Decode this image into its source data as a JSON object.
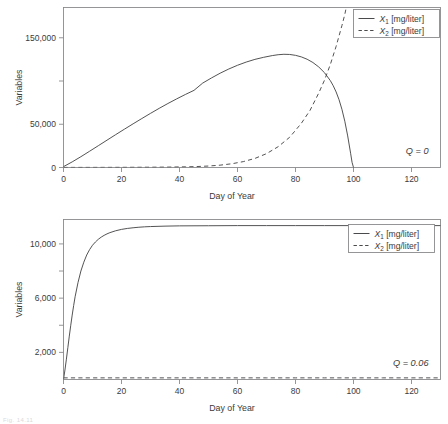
{
  "figure": {
    "background_color": "#ffffff",
    "line_color": "#4a4a4c",
    "frame_color": "#8a8a8d",
    "text_color": "#3b3b3d",
    "footer_fragment": "Fig. 14.11"
  },
  "chart_data": [
    {
      "type": "line",
      "panel_id": "top",
      "title": "",
      "xlabel": "Day of Year",
      "ylabel": "Variables",
      "xlim": [
        0,
        130
      ],
      "ylim": [
        0,
        185000
      ],
      "grid": false,
      "xticks": [
        0,
        20,
        40,
        60,
        80,
        100,
        120
      ],
      "xtick_labels": [
        "0",
        "20",
        "40",
        "60",
        "80",
        "100",
        "120"
      ],
      "yticks": [
        0,
        50000,
        100000,
        150000
      ],
      "ytick_labels": [
        "0",
        "50,000",
        "",
        "150,000"
      ],
      "annotation": "Q = 0",
      "annotation_symbol": "Q",
      "annotation_value": "0",
      "legend_position": "top-right-outside",
      "series": [
        {
          "name": "X_1 [mg/liter]",
          "label_base": "X",
          "label_sub": "1",
          "label_unit": "[mg/liter]",
          "style": "solid",
          "x": [
            0,
            3,
            6,
            9,
            12,
            15,
            18,
            21,
            24,
            27,
            30,
            33,
            36,
            39,
            42,
            45,
            48,
            51,
            54,
            57,
            60,
            63,
            66,
            69,
            72,
            74,
            76,
            78,
            80,
            82,
            84,
            86,
            88,
            90,
            92,
            93,
            94,
            95,
            96,
            97,
            98,
            99,
            99.5,
            100
          ],
          "y": [
            1000,
            6500,
            12500,
            18800,
            25200,
            31600,
            38000,
            44300,
            50500,
            56600,
            62600,
            68400,
            74000,
            79300,
            84400,
            89200,
            97600,
            103500,
            109000,
            113900,
            118200,
            121900,
            125000,
            127400,
            129400,
            130400,
            130900,
            130700,
            129700,
            127900,
            125200,
            121400,
            116300,
            109600,
            100500,
            94600,
            87400,
            78500,
            67400,
            53500,
            36500,
            16500,
            6000,
            0
          ]
        },
        {
          "name": "X_2 [mg/liter]",
          "label_base": "X",
          "label_sub": "2",
          "label_unit": "[mg/liter]",
          "style": "dashed",
          "x": [
            0,
            10,
            20,
            30,
            36,
            42,
            46,
            50,
            54,
            58,
            62,
            66,
            70,
            74,
            78,
            82,
            85,
            88,
            90,
            92,
            94,
            95,
            96,
            97,
            97.5
          ],
          "y": [
            100,
            140,
            210,
            330,
            470,
            760,
            1100,
            1700,
            2700,
            4300,
            6800,
            10500,
            16000,
            24000,
            35000,
            51000,
            66000,
            86000,
            101000,
            119000,
            140000,
            152000,
            164000,
            177000,
            185000
          ]
        }
      ]
    },
    {
      "type": "line",
      "panel_id": "bottom",
      "title": "",
      "xlabel": "Day of Year",
      "ylabel": "Variables",
      "xlim": [
        0,
        130
      ],
      "ylim": [
        0,
        11800
      ],
      "grid": false,
      "xticks": [
        0,
        20,
        40,
        60,
        80,
        100,
        120
      ],
      "xtick_labels": [
        "0",
        "20",
        "40",
        "60",
        "80",
        "100",
        "120"
      ],
      "yticks": [
        2000,
        4000,
        6000,
        8000,
        10000
      ],
      "ytick_labels": [
        "2,000",
        "",
        "6,000",
        "",
        "10,000"
      ],
      "annotation": "Q = 0.06",
      "annotation_symbol": "Q",
      "annotation_value": "0.06",
      "legend_position": "top-right-inside",
      "series": [
        {
          "name": "X_1 [mg/liter]",
          "label_base": "X",
          "label_sub": "1",
          "label_unit": "[mg/liter]",
          "style": "solid",
          "x": [
            0,
            0.5,
            1,
            1.5,
            2,
            2.5,
            3,
            3.5,
            4,
            5,
            6,
            7,
            8,
            9,
            10,
            11,
            12,
            13,
            14,
            15,
            16,
            18,
            20,
            22,
            24,
            26,
            28,
            30,
            35,
            40,
            50,
            60,
            70,
            80,
            90,
            100,
            110,
            120,
            130
          ],
          "y": [
            0,
            700,
            1500,
            2350,
            3200,
            4000,
            4750,
            5450,
            6100,
            7150,
            8000,
            8650,
            9180,
            9580,
            9900,
            10140,
            10340,
            10500,
            10630,
            10740,
            10830,
            10970,
            11070,
            11140,
            11190,
            11230,
            11260,
            11280,
            11310,
            11330,
            11340,
            11350,
            11350,
            11350,
            11350,
            11350,
            11350,
            11350,
            11350
          ]
        },
        {
          "name": "X_2 [mg/liter]",
          "label_base": "X",
          "label_sub": "2",
          "label_unit": "[mg/liter]",
          "style": "dashed",
          "x": [
            0,
            10,
            20,
            30,
            40,
            50,
            60,
            70,
            80,
            90,
            100,
            110,
            120,
            130
          ],
          "y": [
            120,
            120,
            120,
            120,
            120,
            120,
            120,
            120,
            120,
            120,
            120,
            120,
            120,
            120
          ]
        }
      ]
    }
  ]
}
